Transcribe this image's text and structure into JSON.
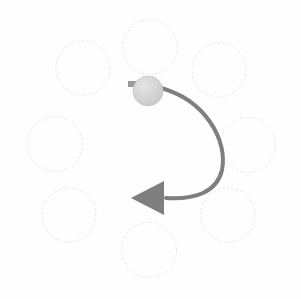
{
  "canvas": {
    "width": 301,
    "height": 299,
    "background_color": "#fefefe",
    "title": "Rotation gesture diagram"
  },
  "palette": {
    "background": "#fefefe",
    "slot_outline": "#e6e6e6",
    "slot_outline_soft": "#ededed",
    "ball_fill": "#cfcfcf",
    "ball_fill_light": "#e0e0e0",
    "ball_outline": "#c4c4c4",
    "nub_fill": "#9a9a9a",
    "arrow_stroke": "#7f7f7f",
    "arrow_head_fill": "#7f7f7f"
  },
  "ring": {
    "label": "radial slot ring",
    "center_x": 149,
    "center_y": 144,
    "orbit_radius": 95,
    "slot_radius": 27.5,
    "slot_stroke_width": 1,
    "slot_dash": "1.5 3",
    "count": 8,
    "slots": [
      {
        "name": "slot-top",
        "position": "top",
        "cx": 150,
        "cy": 47,
        "r": 27.5
      },
      {
        "name": "slot-top-right",
        "position": "top-right",
        "cx": 219,
        "cy": 70,
        "r": 27
      },
      {
        "name": "slot-right",
        "position": "right",
        "cx": 248,
        "cy": 145,
        "r": 27.5
      },
      {
        "name": "slot-bottom-right",
        "position": "bottom-right",
        "cx": 228,
        "cy": 215,
        "r": 27
      },
      {
        "name": "slot-bottom",
        "position": "bottom",
        "cx": 149,
        "cy": 250,
        "r": 27.5
      },
      {
        "name": "slot-bottom-left",
        "position": "bottom-left",
        "cx": 69,
        "cy": 215,
        "r": 27
      },
      {
        "name": "slot-left",
        "position": "left",
        "cx": 55,
        "cy": 144,
        "r": 27.5
      },
      {
        "name": "slot-top-left",
        "position": "top-left",
        "cx": 83,
        "cy": 68,
        "r": 27
      }
    ]
  },
  "handle": {
    "name": "rotation-handle",
    "cx": 148,
    "cy": 91,
    "r": 15,
    "fill": "#cfcfcf",
    "nub": {
      "name": "handle-nub",
      "x": 128,
      "y": 81,
      "width": 10,
      "height": 6,
      "fill": "#9a9a9a"
    }
  },
  "arrow": {
    "name": "rotation-arrow",
    "direction": "clockwise-sweep-right-then-left",
    "stroke_color": "#7f7f7f",
    "stroke_width": 4,
    "path": "M 161 88 C 205 100 228 140 222 170 C 217 192 195 200 166 198",
    "head": {
      "name": "arrow-head",
      "points": "131,198 164,181 164,215",
      "fill": "#7f7f7f",
      "points_label": "left-pointing triangle"
    }
  }
}
